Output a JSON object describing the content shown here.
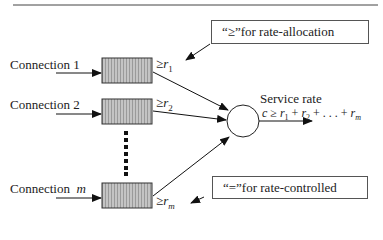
{
  "diagram": {
    "notes": {
      "top": "“≥”for rate-allocation",
      "bottom": "“=”for rate-controlled"
    },
    "connections": [
      {
        "label": "Connection  1",
        "rate_prefix": "≥",
        "rate_var": "r",
        "rate_sub": "1"
      },
      {
        "label": "Connection  2",
        "rate_prefix": "≥",
        "rate_var": "r",
        "rate_sub": "2"
      },
      {
        "label": "Connection",
        "label_var": "m",
        "rate_prefix": "≥",
        "rate_var": "r",
        "rate_sub": "m"
      }
    ],
    "server": {
      "title": "Service rate",
      "formula": "c ≥ r1 + r2 + . . . + rm"
    },
    "colors": {
      "queue_fill": "#b8b8b8",
      "line": "#222222"
    }
  }
}
